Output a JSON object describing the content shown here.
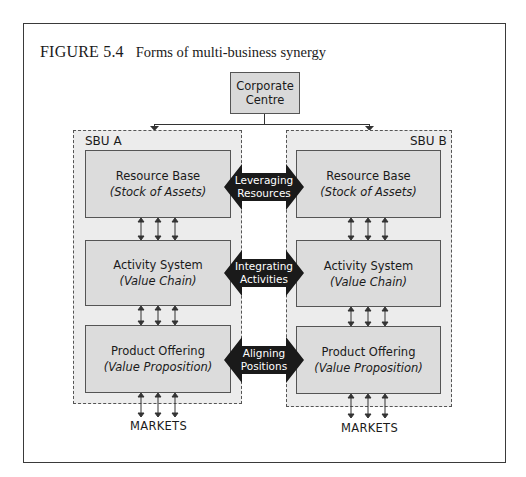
{
  "figure": {
    "number": "FIGURE 5.4",
    "title": "Forms of multi-business synergy"
  },
  "corporate": {
    "line1": "Corporate",
    "line2": "Centre"
  },
  "sbu_a": {
    "label": "SBU A",
    "boxes": [
      {
        "title": "Resource Base",
        "subtitle": "(Stock of Assets)"
      },
      {
        "title": "Activity System",
        "subtitle": "(Value Chain)"
      },
      {
        "title": "Product Offering",
        "subtitle": "(Value Proposition)"
      }
    ],
    "market": "MARKETS"
  },
  "sbu_b": {
    "label": "SBU B",
    "boxes": [
      {
        "title": "Resource Base",
        "subtitle": "(Stock of Assets)"
      },
      {
        "title": "Activity System",
        "subtitle": "(Value Chain)"
      },
      {
        "title": "Product Offering",
        "subtitle": "(Value Proposition)"
      }
    ],
    "market": "MARKETS"
  },
  "synergies": [
    {
      "line1": "Leveraging",
      "line2": "Resources"
    },
    {
      "line1": "Integrating",
      "line2": "Activities"
    },
    {
      "line1": "Aligning",
      "line2": "Positions"
    }
  ],
  "colors": {
    "arrow_fill": "#1a1a1a",
    "box_fill": "#dcdcdc",
    "sbu_fill": "#ececec"
  }
}
